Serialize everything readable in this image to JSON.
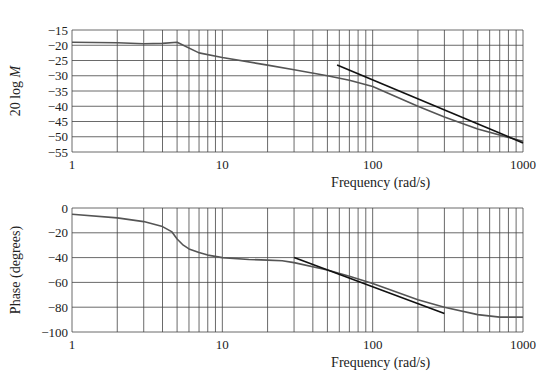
{
  "chart_data": [
    {
      "type": "line",
      "title": "",
      "xlabel": "Frequency (rad/s)",
      "ylabel": "20 log M",
      "xscale": "log",
      "xlim": [
        1,
        1000
      ],
      "ylim": [
        -55,
        -15
      ],
      "xticks": [
        "1",
        "10",
        "100",
        "1000"
      ],
      "yticks": [
        -15,
        -20,
        -25,
        -30,
        -35,
        -40,
        -45,
        -50,
        -55
      ],
      "grid": true,
      "series": [
        {
          "name": "actual",
          "x": [
            1,
            2,
            3,
            4,
            5,
            7,
            10,
            20,
            30,
            50,
            70,
            100,
            200,
            300,
            500,
            1000
          ],
          "y": [
            -19,
            -19.2,
            -19.5,
            -19.4,
            -19,
            -22.5,
            -24,
            -26.5,
            -28,
            -30,
            -31.5,
            -33.5,
            -40,
            -43.5,
            -47.5,
            -51.5
          ]
        },
        {
          "name": "asymptote",
          "x": [
            58,
            1000
          ],
          "y": [
            -26.5,
            -52
          ]
        }
      ]
    },
    {
      "type": "line",
      "title": "",
      "xlabel": "Frequency (rad/s)",
      "ylabel": "Phase (degrees)",
      "xscale": "log",
      "xlim": [
        1,
        1000
      ],
      "ylim": [
        -100,
        0
      ],
      "xticks": [
        "1",
        "10",
        "100",
        "1000"
      ],
      "yticks": [
        0,
        -20,
        -40,
        -60,
        -80,
        -100
      ],
      "grid": true,
      "series": [
        {
          "name": "actual",
          "x": [
            1,
            2,
            3,
            4,
            4.6,
            5,
            5.5,
            6,
            7,
            8,
            10,
            15,
            20,
            25,
            30,
            50,
            70,
            100,
            200,
            300,
            500,
            700,
            1000
          ],
          "y": [
            -5,
            -8,
            -11,
            -15,
            -19,
            -25,
            -30,
            -33,
            -36,
            -38,
            -40,
            -41.5,
            -42,
            -42.5,
            -44,
            -50,
            -55,
            -61,
            -74,
            -80,
            -86,
            -88,
            -88
          ]
        },
        {
          "name": "asymptote",
          "x": [
            30,
            300
          ],
          "y": [
            -40,
            -85
          ]
        }
      ]
    }
  ]
}
